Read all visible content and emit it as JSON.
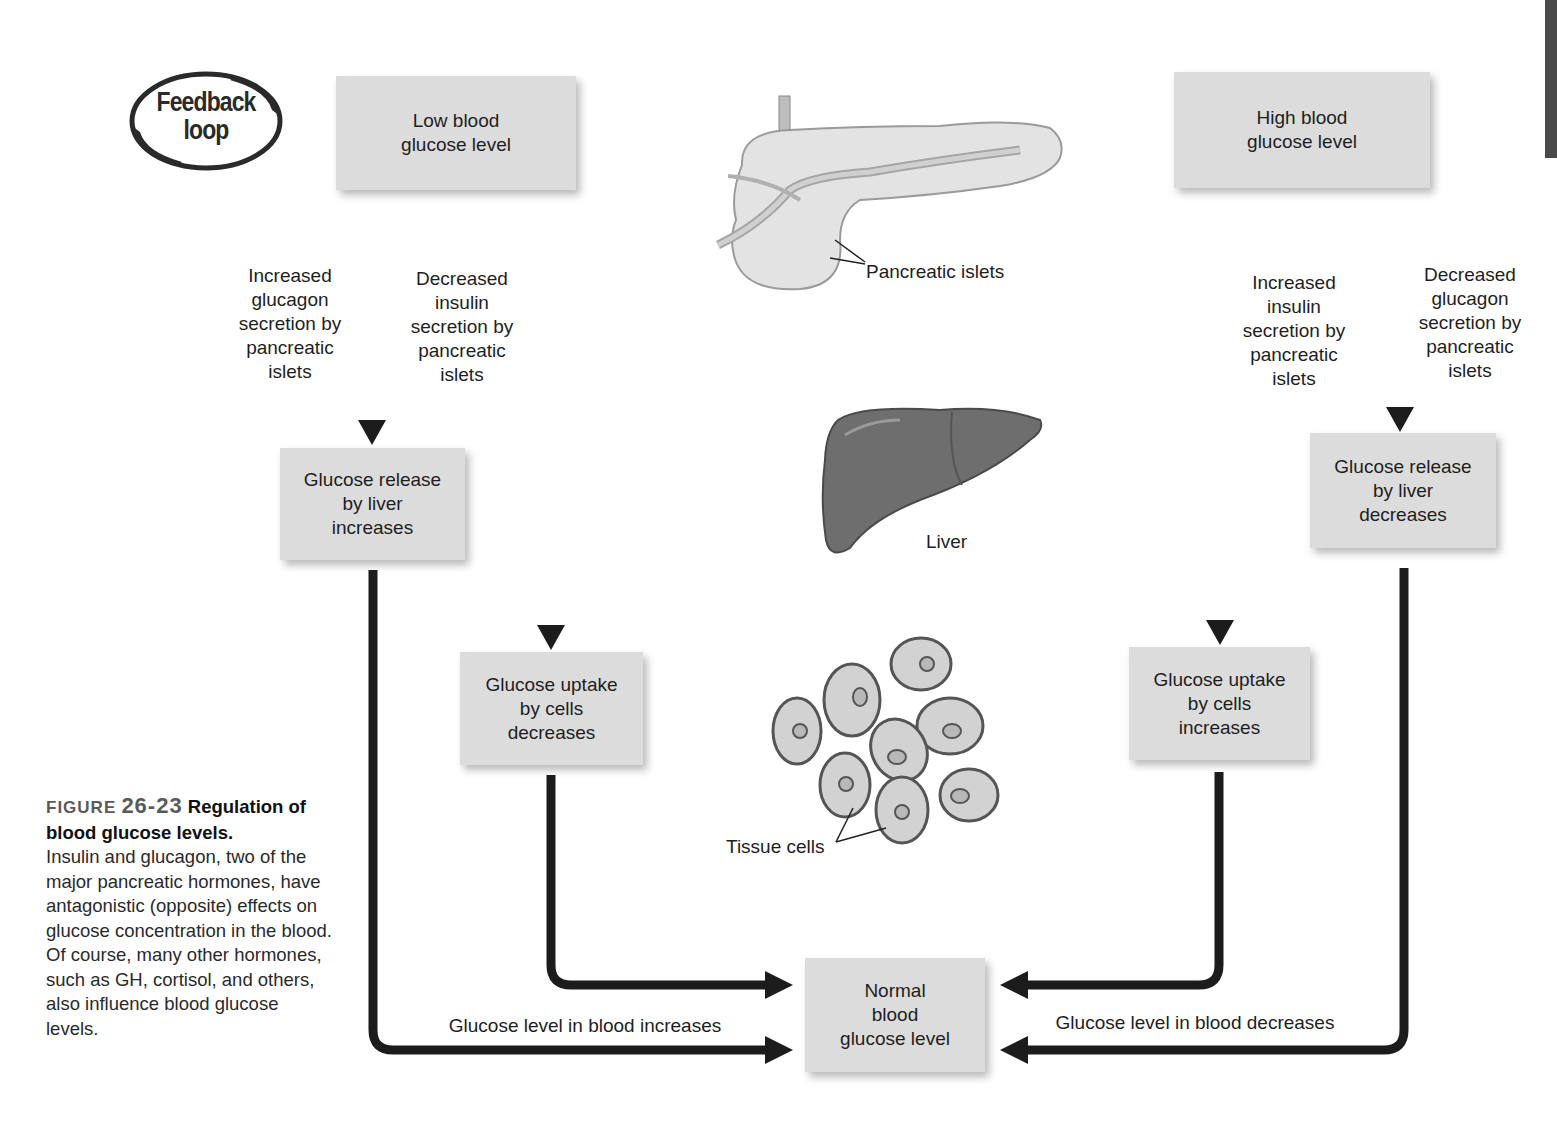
{
  "badge": {
    "text": "Feedback\nloop"
  },
  "boxes": {
    "low": "Low blood\nglucose level",
    "high": "High blood\nglucose level",
    "release_increases": "Glucose release\nby liver\nincreases",
    "uptake_decreases": "Glucose uptake\nby cells\ndecreases",
    "release_decreases": "Glucose release\nby liver\ndecreases",
    "uptake_increases": "Glucose uptake\nby cells\nincreases",
    "normal": "Normal\nblood\nglucose level"
  },
  "arrow_labels": {
    "inc_glucagon": "Increased\nglucagon\nsecretion by\npancreatic\nislets",
    "dec_insulin": "Decreased\ninsulin\nsecretion by\npancreatic\nislets",
    "inc_insulin": "Increased\ninsulin\nsecretion by\npancreatic\nislets",
    "dec_glucagon": "Decreased\nglucagon\nsecretion by\npancreatic\nislets",
    "blood_increases": "Glucose level in blood increases",
    "blood_decreases": "Glucose level in blood decreases"
  },
  "illustrations": {
    "pancreas_label": "Pancreatic islets",
    "liver_label": "Liver",
    "cells_label": "Tissue cells"
  },
  "caption": {
    "figure_word": "FIGURE",
    "figure_number": "26-23",
    "title": "Regulation of blood glucose levels.",
    "body": "Insulin and glucagon, two of the major pancreatic hormones, have antagonistic (opposite) effects on glucose concentration in the blood. Of course, many other hormones, such as GH, cortisol, and others, also influence blood glucose levels."
  },
  "colors": {
    "box_fill": "#dcdcdc",
    "arrow": "#1c1c1c",
    "liver": "#6a6a6a",
    "cell_fill": "#cfcfcf",
    "cell_border": "#555555"
  }
}
